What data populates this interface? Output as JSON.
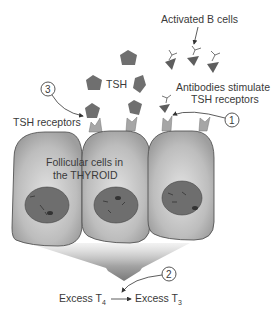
{
  "diagram": {
    "labels": {
      "activated_b_cells": "Activated B cells",
      "tsh": "TSH",
      "antibodies_line1": "Antibodies stimulate",
      "antibodies_line2": "TSH receptors",
      "tsh_receptors": "TSH receptors",
      "follicular_line1": "Follicular cells in",
      "follicular_line2": "the THYROID",
      "excess_t4_prefix": "Excess T",
      "excess_t4_sub": "4",
      "excess_t3_prefix": "Excess T",
      "excess_t3_sub": "3"
    },
    "callouts": [
      "1",
      "2",
      "3"
    ],
    "colors": {
      "cell_fill": "#b8b8b8",
      "cell_edge": "#555555",
      "nucleus": "#6e6e6e",
      "receptor": "#a6a6a6",
      "tsh_pentagon": "#6f6f6f",
      "antibody": "#5e5e5e",
      "funnel": "#7a7a7a"
    }
  }
}
